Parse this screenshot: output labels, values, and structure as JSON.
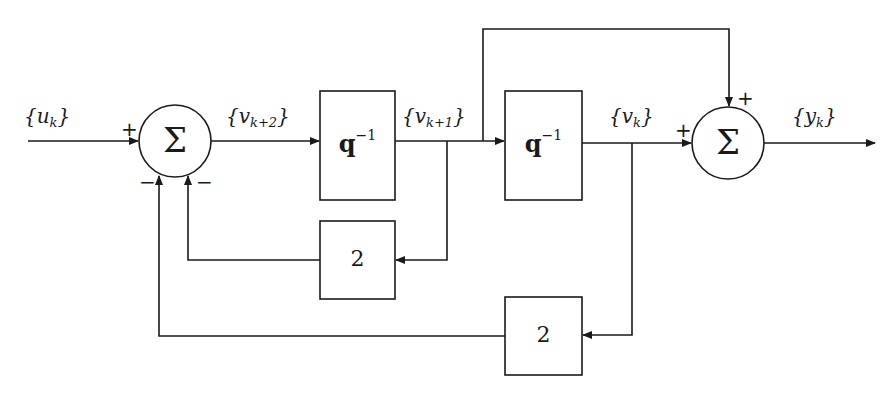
{
  "diagram": {
    "title": "",
    "signals": {
      "input": {
        "base": "{u",
        "sub": "k",
        "close": "}"
      },
      "after_sum1": {
        "base": "{v",
        "sub": "k+2",
        "close": "}"
      },
      "after_delay1": {
        "base": "{v",
        "sub": "k+1",
        "close": "}"
      },
      "after_delay2": {
        "base": "{v",
        "sub": "k",
        "close": "}"
      },
      "output": {
        "base": "{y",
        "sub": "k",
        "close": "}"
      }
    },
    "summing_junctions": [
      {
        "id": "sum1",
        "symbol": "Σ",
        "signs": {
          "left": "+",
          "bottom_left": "−",
          "bottom_right": "−"
        }
      },
      {
        "id": "sum2",
        "symbol": "Σ",
        "signs": {
          "left": "+",
          "top": "+"
        }
      }
    ],
    "blocks": [
      {
        "id": "delay1",
        "base": "q",
        "sup": "−1"
      },
      {
        "id": "delay2",
        "base": "q",
        "sup": "−1"
      },
      {
        "id": "gain1",
        "label": "2"
      },
      {
        "id": "gain2",
        "label": "2"
      }
    ],
    "colors": {
      "line": "#1a1a1a",
      "background": "#ffffff"
    }
  }
}
